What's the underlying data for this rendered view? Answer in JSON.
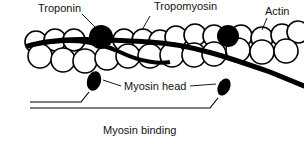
{
  "diagram": {
    "caption": "Myosin binding",
    "labels": {
      "troponin": "Troponin",
      "tropomyosin": "Tropomyosin",
      "actin": "Actin",
      "myosin_head": "Myosin head"
    },
    "colors": {
      "ink": "#000000",
      "background": "#ffffff"
    }
  }
}
